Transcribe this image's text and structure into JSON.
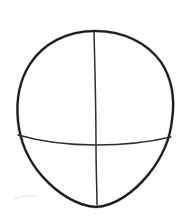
{
  "canvas": {
    "width": 187,
    "height": 224,
    "background_color": "#ffffff",
    "title": "Head construction guide sketch"
  },
  "drawing": {
    "medium": "pencil-line-drawing",
    "subject": "head-oval-with-construction-guidelines",
    "ink_color": "#1a1a1a",
    "guide_color": "#2e2e2e",
    "stroke_width_outline": 2.1,
    "stroke_width_guide": 1.5,
    "shapes": [
      {
        "name": "head-outline",
        "type": "closed-path",
        "description": "egg shaped head outline, wide rounded cranium tapering to a softly flattened chin",
        "bounds": {
          "left": 16,
          "top": 31,
          "right": 175,
          "bottom": 208
        },
        "widest_y": 100,
        "top_point": {
          "x": 95,
          "y": 31
        },
        "bottom_point": {
          "x": 96,
          "y": 207
        },
        "path": "M 95 31 C 66 31 43 44 30 64 C 19 81 16 101 18 121 C 20 141 28 160 42 176 C 57 193 77 206 96 207 C 115 206 134 192 148 175 C 161 159 170 140 172 120 C 175 100 172 79 161 62 C 147 43 124 31 95 31 Z"
      },
      {
        "name": "vertical-center-line",
        "type": "open-path",
        "description": "vertical centre construction line running from crown to chin, tilted very slightly",
        "start_point": {
          "x": 94,
          "y": 32
        },
        "end_point": {
          "x": 97,
          "y": 205
        },
        "path": "M 94 32 C 95 70 96 110 96 145 C 96 170 97 190 97 205"
      },
      {
        "name": "horizontal-eye-line",
        "type": "open-path",
        "description": "horizontal eye-level construction line, bowing gently downward through the centre",
        "start_point": {
          "x": 18,
          "y": 135
        },
        "end_point": {
          "x": 171,
          "y": 137
        },
        "mid_point": {
          "x": 96,
          "y": 145
        },
        "path": "M 18 135 C 46 143 72 145 96 145 C 124 145 150 142 171 137"
      },
      {
        "name": "paper-smudge",
        "type": "open-path",
        "description": "faint pencil smudge near lower left of the paper",
        "path": "M 14 199 C 22 196 30 195 38 196"
      }
    ],
    "intersection_point": {
      "x": 96,
      "y": 145
    }
  }
}
